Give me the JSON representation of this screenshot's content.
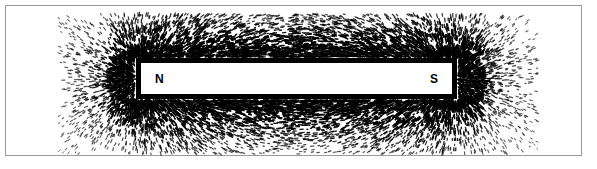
{
  "figure": {
    "background_color": "#ffffff",
    "frame": {
      "color": "#9a9a9a",
      "left": 5,
      "top": 5,
      "width": 577,
      "height": 151
    }
  },
  "magnet": {
    "label": "bar magnet",
    "fill_color": "#ffffff",
    "border_color": "#000000",
    "border_width": 5,
    "left": 136,
    "top": 58,
    "width": 321,
    "height": 41,
    "north_pole_label": "N",
    "south_pole_label": "S"
  },
  "filings": {
    "label": "iron filings",
    "color": "#000000",
    "count": 7200,
    "dash_length_min": 2.0,
    "dash_length_max": 5.2,
    "dash_thickness": 1.15,
    "field_bounds": {
      "x_min": 58,
      "x_max": 538,
      "y_min": 14,
      "y_max": 154
    },
    "dipole": {
      "pole_separation": 321,
      "north_pole_x": 141,
      "south_pole_x": 452,
      "axis_y": 78.5
    }
  }
}
